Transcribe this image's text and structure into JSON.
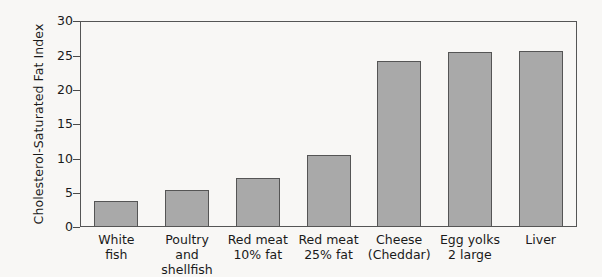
{
  "chart_data": {
    "type": "bar",
    "title": "",
    "xlabel": "",
    "ylabel": "Cholesterol-Saturated Fat Index",
    "ylim": [
      0,
      30
    ],
    "yticks": [
      0,
      5,
      10,
      15,
      20,
      25,
      30
    ],
    "grid": false,
    "legend": null,
    "categories": [
      "White\nfish",
      "Poultry and\nshellfish",
      "Red meat\n10% fat",
      "Red meat\n25% fat",
      "Cheese\n(Cheddar)",
      "Egg yolks\n2 large",
      "Liver"
    ],
    "values": [
      3.8,
      5.4,
      7.2,
      10.6,
      24.3,
      25.6,
      25.8
    ],
    "bar_color": "#a9a9a9",
    "bar_edge_color": "#555555",
    "axis_color": "#555555",
    "background_color": "#f8f7f5"
  },
  "ticks": {
    "t0": "0",
    "t1": "5",
    "t2": "10",
    "t3": "15",
    "t4": "20",
    "t5": "25",
    "t6": "30"
  },
  "axis": {
    "y_title": "Cholesterol-Saturated Fat Index"
  },
  "categories": {
    "c0": "White\nfish",
    "c1": "Poultry and\nshellfish",
    "c2": "Red meat\n10% fat",
    "c3": "Red meat\n25% fat",
    "c4": "Cheese\n(Cheddar)",
    "c5": "Egg yolks\n2 large",
    "c6": "Liver"
  }
}
